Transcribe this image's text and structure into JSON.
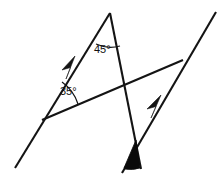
{
  "figure": {
    "type": "geometry-diagram",
    "background_color": "#ffffff",
    "stroke_color": "#141414",
    "fill_color": "#0a0a0a",
    "width": 224,
    "height": 176
  },
  "labels": {
    "angle_top": "45°",
    "angle_left": "35°"
  },
  "angles": [
    {
      "name": "apex-angle",
      "value": 45,
      "label": "45°",
      "marker": "arc",
      "vertex": [
        110,
        13
      ]
    },
    {
      "name": "left-angle",
      "value": 35,
      "label": "35°",
      "marker": "arc",
      "vertex": [
        42,
        120
      ]
    },
    {
      "name": "bottom-shaded-angle",
      "value": null,
      "label": "",
      "marker": "filled-wedge",
      "vertex": [
        136,
        140
      ]
    }
  ],
  "lines": [
    {
      "name": "parallel-line-upper-left",
      "from": [
        15,
        168
      ],
      "to": [
        110,
        13
      ],
      "tick_marks": 1,
      "arrow_at": [
        70,
        68
      ]
    },
    {
      "name": "parallel-line-lower-right",
      "from": [
        122,
        173
      ],
      "to": [
        216,
        12
      ],
      "tick_marks": 1,
      "arrow_at": [
        156,
        107
      ]
    },
    {
      "name": "transversal-lower",
      "from": [
        42,
        120
      ],
      "to": [
        183,
        60
      ],
      "tick_marks": 0
    },
    {
      "name": "transversal-apex",
      "from": [
        110,
        13
      ],
      "to": [
        141,
        169
      ],
      "tick_marks": 0
    }
  ],
  "vertices": [
    {
      "name": "apex-vertex",
      "point": [
        110,
        13
      ]
    },
    {
      "name": "left-vertex",
      "point": [
        42,
        120
      ]
    },
    {
      "name": "right-vertex",
      "point": [
        183,
        60
      ]
    },
    {
      "name": "center-crossing",
      "point": [
        123,
        86
      ]
    },
    {
      "name": "bottom-vertex",
      "point": [
        136,
        140
      ]
    }
  ]
}
